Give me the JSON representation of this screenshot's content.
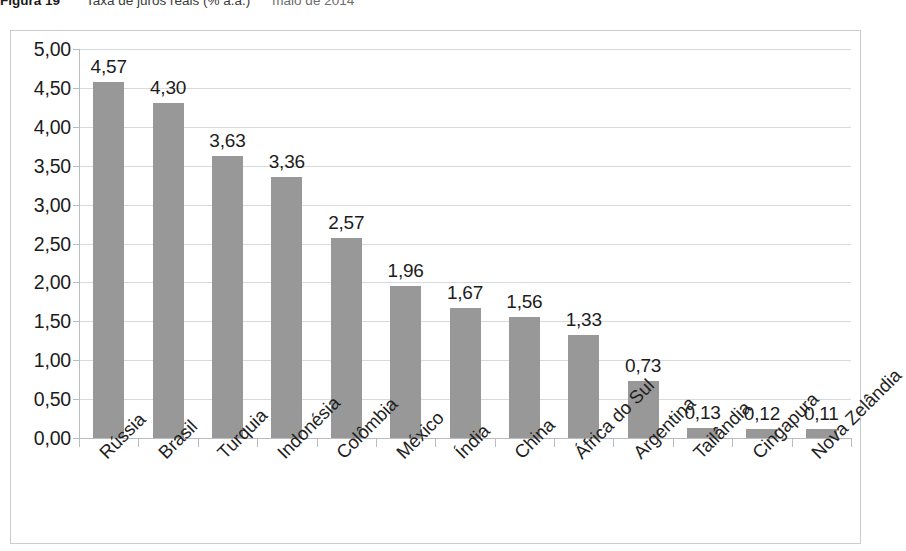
{
  "caption": {
    "label": "Figura 19",
    "text": "Taxa de juros reais (% a.a.)",
    "date": "maio de 2014"
  },
  "chart_data": {
    "type": "bar",
    "xlabel": "",
    "ylabel": "",
    "ylim": [
      0,
      5
    ],
    "ytick_step": 0.5,
    "grid": true,
    "legend": "none",
    "bar_color": "#989898",
    "decimal_separator": ",",
    "categories": [
      "Rússia",
      "Brasil",
      "Turquia",
      "Indonésia",
      "Colômbia",
      "México",
      "Índia",
      "China",
      "África do Sul",
      "Argentina",
      "Tailândia",
      "Cingapura",
      "Nova Zelândia"
    ],
    "values": [
      4.57,
      4.3,
      3.63,
      3.36,
      2.57,
      1.96,
      1.67,
      1.56,
      1.33,
      0.73,
      0.13,
      0.12,
      0.11
    ],
    "value_labels": [
      "4,57",
      "4,30",
      "3,63",
      "3,36",
      "2,57",
      "1,96",
      "1,67",
      "1,56",
      "1,33",
      "0,73",
      "0,13",
      "0,12",
      "0,11"
    ],
    "ytick_labels": [
      "5,00",
      "4,50",
      "4,00",
      "3,50",
      "3,00",
      "2,50",
      "2,00",
      "1,50",
      "1,00",
      "0,50",
      "0,00"
    ],
    "ytick_values": [
      5.0,
      4.5,
      4.0,
      3.5,
      3.0,
      2.5,
      2.0,
      1.5,
      1.0,
      0.5,
      0.0
    ]
  }
}
